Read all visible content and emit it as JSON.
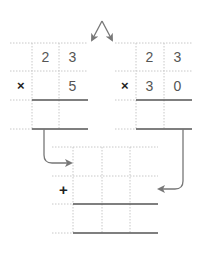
{
  "diagram": {
    "colors": {
      "grid": "#c8c8c8",
      "rule": "#555555",
      "arrow": "#777777",
      "text": "#555555",
      "operator": "#222222"
    },
    "left_problem": {
      "top_digits": [
        "2",
        "3"
      ],
      "operator": "×",
      "bottom_digits": [
        "",
        "5"
      ]
    },
    "right_problem": {
      "top_digits": [
        "2",
        "3"
      ],
      "operator": "×",
      "bottom_digits": [
        "3",
        "0"
      ]
    },
    "sum_problem": {
      "operator": "+"
    }
  }
}
